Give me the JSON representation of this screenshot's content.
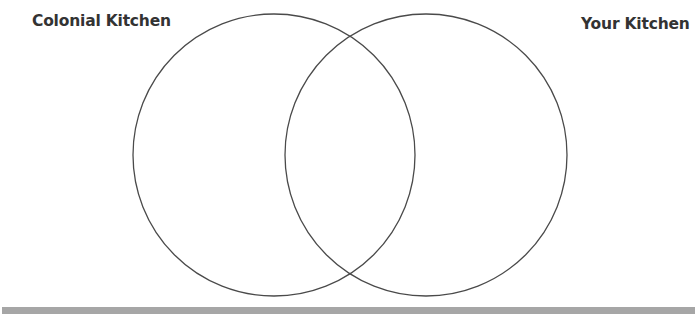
{
  "diagram": {
    "type": "venn",
    "sets": [
      {
        "label": "Colonial Kitchen",
        "cx": 274,
        "cy": 155,
        "r": 141
      },
      {
        "label": "Your Kitchen",
        "cx": 426,
        "cy": 155,
        "r": 141
      }
    ],
    "stroke_color": "#4a4a4a",
    "bar_color": "#a6a6a6"
  }
}
